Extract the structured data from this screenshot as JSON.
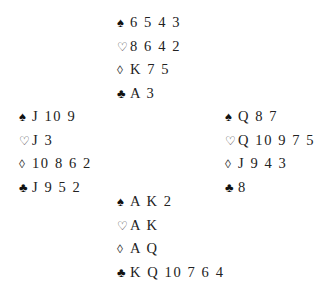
{
  "deal": {
    "north": {
      "spades": "6 5 4 3",
      "hearts": "8 6 4 2",
      "diamonds": "K 7 5",
      "clubs": "A 3"
    },
    "west": {
      "spades": "J 10 9",
      "hearts": "J 3",
      "diamonds": "10 8 6 2",
      "clubs": "J 9 5 2"
    },
    "east": {
      "spades": "Q 8 7",
      "hearts": "Q 10 9 7 5",
      "diamonds": "J 9 4 3",
      "clubs": "8"
    },
    "south": {
      "spades": "A K 2",
      "hearts": "A K",
      "diamonds": "A Q",
      "clubs": "K Q 10 7 6 4"
    }
  },
  "suit_icons": {
    "spades": "♠",
    "hearts": "♡",
    "diamonds": "◊",
    "clubs": "♣"
  }
}
